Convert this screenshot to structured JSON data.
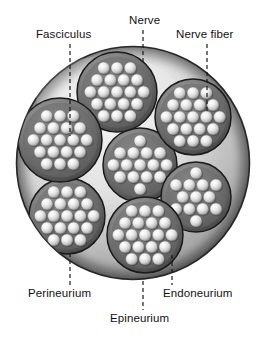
{
  "figure": {
    "type": "anatomical-diagram",
    "background_color": "#ffffff",
    "text_color": "#111111"
  },
  "labels": {
    "fasciculus": "Fasciculus",
    "nerve": "Nerve",
    "nerve_fiber": "Nerve fiber",
    "perineurium": "Perineurium",
    "endoneurium": "Endoneurium",
    "epineurium": "Epineurium"
  },
  "structure": {
    "nerve_trunk": {
      "center_x": 133,
      "center_y": 163,
      "radius": 117,
      "fill_light": "#e9e9e9",
      "fill_dark": "#8d8d8d",
      "stroke": "#2b2b2b"
    },
    "fascicle_count": 7,
    "fascicles": [
      {
        "name": "center",
        "cx": 140,
        "cy": 165,
        "r": 37
      },
      {
        "name": "top",
        "cx": 117,
        "cy": 92,
        "r": 40
      },
      {
        "name": "upper-right",
        "cx": 193,
        "cy": 117,
        "r": 38
      },
      {
        "name": "right",
        "cx": 196,
        "cy": 197,
        "r": 35
      },
      {
        "name": "bottom",
        "cx": 145,
        "cy": 235,
        "r": 38
      },
      {
        "name": "lower-left",
        "cx": 67,
        "cy": 216,
        "r": 38
      },
      {
        "name": "left",
        "cx": 60,
        "cy": 140,
        "r": 42
      }
    ],
    "fascicle_fill_dark": "#5d5d5d",
    "fascicle_fill_mid": "#8a8a8a",
    "fascicle_stroke": "#1a1a1a",
    "fiber_fill_light": "#f2f2f2",
    "fiber_fill_shadow": "#7a7a7a",
    "fiber_radius": 6
  },
  "leaders": [
    {
      "name": "fasciculus-leader",
      "x1": 70,
      "y1": 44,
      "x2": 70,
      "y2": 136
    },
    {
      "name": "nerve-leader",
      "x1": 143,
      "y1": 30,
      "x2": 143,
      "y2": 62
    },
    {
      "name": "nerve-fiber-leader",
      "x1": 207,
      "y1": 44,
      "x2": 207,
      "y2": 112
    },
    {
      "name": "perineurium-leader",
      "x1": 70,
      "y1": 253,
      "x2": 70,
      "y2": 285
    },
    {
      "name": "endoneurium-leader",
      "x1": 172,
      "y1": 255,
      "x2": 172,
      "y2": 285
    },
    {
      "name": "epineurium-leader",
      "x1": 143,
      "y1": 281,
      "x2": 143,
      "y2": 310
    }
  ]
}
